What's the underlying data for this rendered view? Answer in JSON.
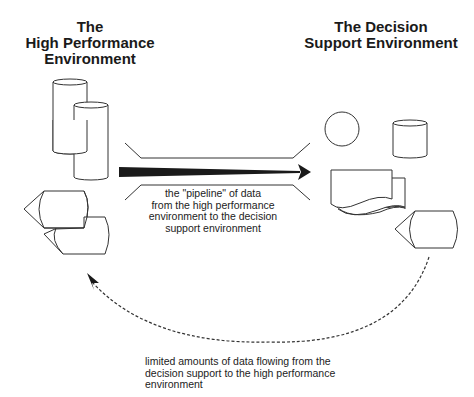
{
  "diagram": {
    "left_environment": {
      "title_lines": [
        "The",
        "High Performance",
        "Environment"
      ],
      "shapes": [
        "cylinder",
        "cylinder",
        "tape-drive",
        "tape-drive"
      ]
    },
    "right_environment": {
      "title_lines": [
        "The Decision",
        "Support Environment"
      ],
      "shapes": [
        "circle",
        "cylinder",
        "document-stack",
        "tape-drive"
      ]
    },
    "pipeline": {
      "caption_lines": [
        "the \"pipeline\" of data",
        "from the high performance",
        "environment to the decision",
        "support environment"
      ],
      "direction": "left-to-right"
    },
    "return_flow": {
      "caption_lines": [
        "limited amounts of data flowing from the",
        "decision support to the high performance",
        "environment"
      ],
      "style": "dashed",
      "direction": "right-to-left"
    },
    "colors": {
      "stroke": "#333333",
      "text": "#1a1a1a",
      "background": "#ffffff"
    }
  }
}
